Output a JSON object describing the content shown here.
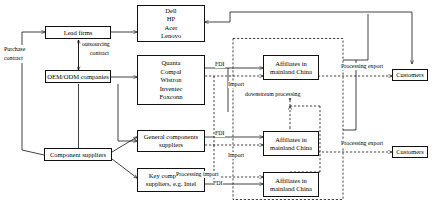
{
  "diagram": {
    "type": "flow-diagram",
    "nodes": {
      "lead_firms": {
        "label": "Lead firms"
      },
      "oem_odm": {
        "label": "OEM/ODM companies"
      },
      "component_suppliers": {
        "label": "Component suppliers"
      },
      "brands": {
        "lines": [
          "Dell",
          "HP",
          "Acer",
          "Lenovo"
        ]
      },
      "contract_manufacturers": {
        "lines": [
          "Quanta",
          "Compal",
          "Wistron",
          "Inventec",
          "Foxconn"
        ]
      },
      "general_components": {
        "lines": [
          "General components",
          "suppliers"
        ]
      },
      "key_components": {
        "lines": [
          "Key components",
          "suppliers, e.g. Intel"
        ]
      },
      "affiliate_top": {
        "lines": [
          "Affiliates  in",
          "mainland China"
        ]
      },
      "affiliate_middle": {
        "lines": [
          "Affiliates in",
          "mainland China"
        ]
      },
      "affiliate_bottom": {
        "lines": [
          "Affiliates in",
          "mainland China"
        ]
      },
      "customers_top": {
        "label": "Customers"
      },
      "customers_bottom": {
        "label": "Customers"
      }
    },
    "edge_labels": {
      "purchase_contract": {
        "line1": "Purchase",
        "line2": "contract"
      },
      "outsourcing_contract": {
        "line1": "outsourcing",
        "line2": "contract"
      },
      "fdi_top": {
        "text": "FDI"
      },
      "import_top": {
        "text": "Import"
      },
      "downstream_processing": {
        "text": "downstream processing"
      },
      "processing_export_top": {
        "text": "Processing export"
      },
      "fdi_middle": {
        "text": "FDI"
      },
      "import_middle": {
        "text": "Import"
      },
      "processing_export_bottom": {
        "text": "Processing export"
      },
      "processing_import_bottom": {
        "text": "Processing import"
      },
      "fdi_bottom": {
        "text": "FDI"
      }
    }
  }
}
